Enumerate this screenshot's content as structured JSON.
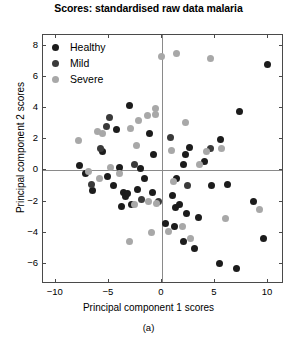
{
  "chart_data": {
    "type": "scatter",
    "title": "Scores: standardised raw data malaria",
    "xlabel": "Principal component 1 scores",
    "ylabel": "Principal component 2 scores",
    "caption": "(a)",
    "xlim": [
      -11.2,
      11.5
    ],
    "ylim": [
      -7.3,
      8.7
    ],
    "xticks": [
      -10,
      -5,
      0,
      5,
      10
    ],
    "xticklabels": [
      "−10",
      "−5",
      "0",
      "5",
      "10"
    ],
    "yticks": [
      -6,
      -4,
      -2,
      0,
      2,
      4,
      6,
      8
    ],
    "yticklabels": [
      "−6",
      "−4",
      "−2",
      "0",
      "2",
      "4",
      "6",
      "8"
    ],
    "grid": false,
    "reference_lines": {
      "x": 0,
      "y": 0,
      "color": "#8a8a8a"
    },
    "legend_position": "top-left",
    "marker": "circle",
    "marker_size_px": 7,
    "series": [
      {
        "name": "Healthy",
        "color": "#1c1c1c",
        "points": [
          [
            9.9,
            6.8
          ],
          [
            7.3,
            3.8
          ],
          [
            5.5,
            2.0
          ],
          [
            2.6,
            1.5
          ],
          [
            4.0,
            0.6
          ],
          [
            2.0,
            0.4
          ],
          [
            -0.8,
            1.0
          ],
          [
            -1.2,
            2.4
          ],
          [
            -3.1,
            4.2
          ],
          [
            -4.3,
            2.6
          ],
          [
            -5.6,
            1.2
          ],
          [
            -7.8,
            0.3
          ],
          [
            -7.2,
            -0.2
          ],
          [
            -6.5,
            -1.3
          ],
          [
            -4.6,
            -1.0
          ],
          [
            -3.6,
            -1.4
          ],
          [
            -3.4,
            -1.7
          ],
          [
            -3.2,
            -1.5
          ],
          [
            -2.9,
            -2.2
          ],
          [
            -3.8,
            -2.3
          ],
          [
            -2.3,
            -1.2
          ],
          [
            -1.6,
            -0.5
          ],
          [
            -0.9,
            -1.4
          ],
          [
            -5.1,
            -0.4
          ],
          [
            -4.0,
            0.2
          ],
          [
            -2.0,
            0.1
          ],
          [
            0.3,
            -3.4
          ],
          [
            1.4,
            -0.5
          ],
          [
            1.0,
            -1.6
          ],
          [
            1.3,
            -2.4
          ],
          [
            1.7,
            -2.2
          ],
          [
            2.3,
            -2.8
          ],
          [
            1.2,
            -3.6
          ],
          [
            2.0,
            -4.6
          ],
          [
            3.1,
            -5.0
          ],
          [
            3.4,
            -3.0
          ],
          [
            4.7,
            -1.0
          ],
          [
            6.2,
            -0.9
          ],
          [
            8.6,
            -2.0
          ],
          [
            9.6,
            -4.4
          ],
          [
            5.4,
            -6.0
          ],
          [
            7.0,
            -6.3
          ],
          [
            2.2,
            1.0
          ]
        ]
      },
      {
        "name": "Mild",
        "color": "#3a3a3a",
        "points": [
          [
            -4.9,
            3.4
          ],
          [
            -5.2,
            2.8
          ],
          [
            -6.6,
            -0.9
          ],
          [
            -1.9,
            -1.9
          ],
          [
            0.8,
            2.1
          ],
          [
            2.4,
            -1.0
          ],
          [
            4.6,
            1.4
          ],
          [
            -0.3,
            -2.0
          ],
          [
            -2.6,
            0.4
          ],
          [
            -5.8,
            1.4
          ]
        ]
      },
      {
        "name": "Severe",
        "color": "#a8a8a8",
        "points": [
          [
            0.0,
            7.3
          ],
          [
            1.4,
            7.5
          ],
          [
            4.6,
            7.2
          ],
          [
            -0.6,
            3.6
          ],
          [
            2.2,
            3.1
          ],
          [
            0.9,
            1.3
          ],
          [
            4.2,
            1.2
          ],
          [
            5.6,
            1.4
          ],
          [
            1.1,
            -0.7
          ],
          [
            -0.5,
            -2.1
          ],
          [
            -1.3,
            -2.0
          ],
          [
            -2.6,
            -2.2
          ],
          [
            -4.8,
            0.2
          ],
          [
            -5.6,
            2.4
          ],
          [
            -6.1,
            2.5
          ],
          [
            -7.9,
            1.9
          ],
          [
            -6.9,
            -0.1
          ],
          [
            -5.9,
            -0.5
          ],
          [
            -4.0,
            -0.2
          ],
          [
            -3.0,
            2.7
          ],
          [
            -2.2,
            3.2
          ],
          [
            -1.4,
            3.5
          ],
          [
            -2.4,
            1.6
          ],
          [
            -0.6,
            4.0
          ],
          [
            0.6,
            -3.9
          ],
          [
            1.9,
            -3.6
          ],
          [
            3.5,
            0.4
          ],
          [
            6.0,
            -3.1
          ],
          [
            9.2,
            -2.5
          ],
          [
            2.7,
            -4.4
          ],
          [
            -1.0,
            -4.0
          ],
          [
            -3.1,
            -4.6
          ]
        ]
      }
    ]
  },
  "legend": {
    "items": [
      {
        "label": "Healthy"
      },
      {
        "label": "Mild"
      },
      {
        "label": "Severe"
      }
    ]
  }
}
